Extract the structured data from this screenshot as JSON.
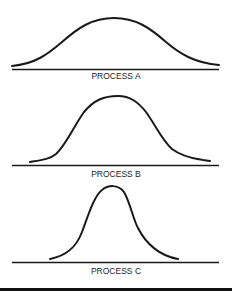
{
  "diagram": {
    "panels": [
      {
        "label": "PROCESS A",
        "description": "wide, flat normal distribution curve"
      },
      {
        "label": "PROCESS B",
        "description": "medium-width normal distribution curve"
      },
      {
        "label": "PROCESS C",
        "description": "narrow, tall normal distribution curve"
      }
    ]
  },
  "colors": {
    "line": "#1a1a1a",
    "background": "#ffffff"
  }
}
